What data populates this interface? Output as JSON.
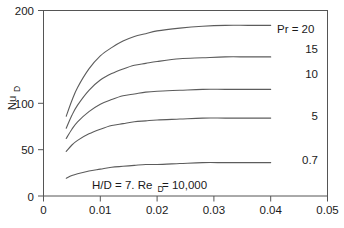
{
  "chart_data": {
    "type": "line",
    "title": "",
    "xlabel": "",
    "ylabel": "Nu",
    "ylabel_sub": "D",
    "xlim": [
      0,
      0.05
    ],
    "ylim": [
      0,
      200
    ],
    "grid": false,
    "legend_position": "right-inline",
    "annotation": "H/D = 7. Re",
    "annotation_sub": "D",
    "annotation_tail": " = 10,000",
    "legend_prefix": "Pr = ",
    "xticks": [
      "0",
      "0.01",
      "0.02",
      "0.03",
      "0.04",
      "0.05"
    ],
    "xtick_values": [
      0,
      0.01,
      0.02,
      0.03,
      0.04,
      0.05
    ],
    "yticks": [
      "0",
      "50",
      "100",
      "200"
    ],
    "ytick_values": [
      0,
      50,
      100,
      200
    ],
    "x": [
      0.004,
      0.005,
      0.006,
      0.008,
      0.01,
      0.012,
      0.014,
      0.016,
      0.018,
      0.02,
      0.024,
      0.028,
      0.032,
      0.036,
      0.04
    ],
    "series": [
      {
        "name": "20",
        "label": "Pr = 20",
        "values": [
          86,
          103,
          117,
          137,
          151,
          160,
          167,
          172,
          175,
          178,
          181,
          183,
          184,
          184,
          184
        ]
      },
      {
        "name": "15",
        "label": "15",
        "values": [
          73,
          87,
          98,
          114,
          125,
          132,
          137,
          141,
          143,
          145,
          148,
          149,
          150,
          150,
          150
        ]
      },
      {
        "name": "10",
        "label": "10",
        "values": [
          62,
          72,
          80,
          91,
          99,
          104,
          108,
          110,
          112,
          113,
          114,
          115,
          115,
          115,
          115
        ]
      },
      {
        "name": "5",
        "label": "5",
        "values": [
          48,
          55,
          60,
          67,
          72,
          76,
          78,
          80,
          81,
          82,
          83,
          84,
          84,
          84,
          84
        ]
      },
      {
        "name": "0.7",
        "label": "0.7",
        "values": [
          19,
          22,
          24,
          27,
          29,
          31,
          32,
          33,
          34,
          34,
          35,
          36,
          36,
          36,
          36
        ]
      }
    ],
    "series_label_y": [
      186,
      152,
      117,
      83,
      40
    ]
  }
}
